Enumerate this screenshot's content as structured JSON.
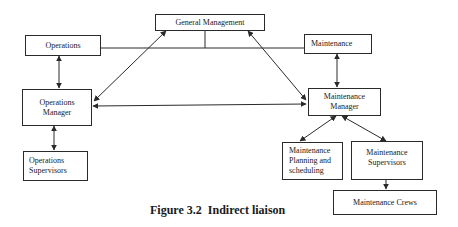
{
  "diagram": {
    "caption": {
      "number": "Figure 3.2",
      "text": "Indirect liaison"
    },
    "nodes": {
      "general_management": {
        "lines": [
          "General Management"
        ]
      },
      "operations": {
        "lines": [
          "Operations"
        ]
      },
      "maintenance": {
        "lines": [
          "Maintenance"
        ]
      },
      "operations_manager": {
        "lines": [
          "Operations",
          "Manager"
        ]
      },
      "maintenance_manager": {
        "lines": [
          "Maintenance",
          "Manager"
        ]
      },
      "operations_supervisors": {
        "lines": [
          "Operations",
          "Supervisors"
        ]
      },
      "maintenance_planning": {
        "lines": [
          "Maintenance",
          "Planning and",
          "scheduling"
        ]
      },
      "maintenance_supervisors": {
        "lines": [
          "Maintenance",
          "Supervisors"
        ]
      },
      "maintenance_crews": {
        "lines": [
          "Maintenance Crews"
        ]
      }
    },
    "edges": [
      {
        "from": "general_management",
        "to": [
          "operations",
          "maintenance"
        ],
        "type": "line"
      },
      {
        "from": "general_management",
        "to": "operations_manager",
        "type": "double-arrow"
      },
      {
        "from": "general_management",
        "to": "maintenance_manager",
        "type": "double-arrow"
      },
      {
        "from": "operations",
        "to": "operations_manager",
        "type": "double-arrow"
      },
      {
        "from": "maintenance",
        "to": "maintenance_manager",
        "type": "double-arrow"
      },
      {
        "from": "operations_manager",
        "to": "maintenance_manager",
        "type": "double-arrow"
      },
      {
        "from": "operations_manager",
        "to": "operations_supervisors",
        "type": "double-arrow"
      },
      {
        "from": "maintenance_manager",
        "to": "maintenance_planning",
        "type": "double-arrow"
      },
      {
        "from": "maintenance_manager",
        "to": "maintenance_supervisors",
        "type": "double-arrow"
      },
      {
        "from": "maintenance_supervisors",
        "to": "maintenance_crews",
        "type": "arrow"
      }
    ],
    "colors": {
      "stroke": "#2a2a2a",
      "background": "#ffffff",
      "text": "#1a1a1a"
    }
  }
}
